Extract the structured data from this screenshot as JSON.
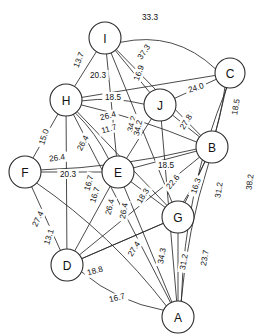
{
  "chart_data": {
    "type": "diagram",
    "title": "",
    "subtitle": "",
    "xlabel": "",
    "ylabel": "",
    "graph_kind": "weighted-undirected-graph",
    "nodes": [
      {
        "id": "I",
        "label": "I",
        "x": 105,
        "y": 38,
        "r": 16
      },
      {
        "id": "C",
        "label": "C",
        "x": 230,
        "y": 73,
        "r": 15
      },
      {
        "id": "H",
        "label": "H",
        "x": 66,
        "y": 100,
        "r": 16
      },
      {
        "id": "J",
        "label": "J",
        "x": 160,
        "y": 105,
        "r": 16
      },
      {
        "id": "B",
        "label": "B",
        "x": 212,
        "y": 147,
        "r": 16
      },
      {
        "id": "F",
        "label": "F",
        "x": 25,
        "y": 172,
        "r": 16
      },
      {
        "id": "E",
        "label": "E",
        "x": 118,
        "y": 172,
        "r": 16
      },
      {
        "id": "G",
        "label": "G",
        "x": 178,
        "y": 217,
        "r": 16
      },
      {
        "id": "D",
        "label": "D",
        "x": 67,
        "y": 265,
        "r": 16
      },
      {
        "id": "A",
        "label": "A",
        "x": 178,
        "y": 317,
        "r": 16
      }
    ],
    "edges": [
      {
        "source": "I",
        "target": "C",
        "weight": "33.3",
        "lx": 150,
        "ly": 17,
        "curve": -26,
        "rot": 0
      },
      {
        "source": "I",
        "target": "H",
        "weight": "13.7",
        "lx": 79,
        "ly": 60,
        "curve": 0,
        "rot": -68
      },
      {
        "source": "I",
        "target": "B",
        "weight": "37.3",
        "lx": 144,
        "ly": 52,
        "curve": 0,
        "rot": -56
      },
      {
        "source": "I",
        "target": "J",
        "weight": "16.9",
        "lx": 139,
        "ly": 73,
        "curve": 0,
        "rot": -70
      },
      {
        "source": "I",
        "target": "E",
        "weight": "34.2",
        "lx": 132,
        "ly": 124,
        "curve": 0,
        "rot": -76
      },
      {
        "source": "I",
        "target": "G",
        "weight": "27.8",
        "lx": 187,
        "ly": 119,
        "curve": 0,
        "rot": -60
      },
      {
        "source": "H",
        "target": "J",
        "weight": "20.3",
        "lx": 98,
        "ly": 75,
        "curve": -6,
        "rot": 0
      },
      {
        "source": "H",
        "target": "C",
        "weight": "18.5",
        "lx": 113,
        "ly": 97,
        "curve": 0,
        "rot": 0
      },
      {
        "source": "H",
        "target": "B",
        "weight": "26.4",
        "lx": 108,
        "ly": 116,
        "curve": -5,
        "rot": -14
      },
      {
        "source": "H",
        "target": "E",
        "weight": "11.7",
        "lx": 109,
        "ly": 129,
        "curve": -5,
        "rot": -16
      },
      {
        "source": "H",
        "target": "F",
        "weight": "15.0",
        "lx": 44,
        "ly": 137,
        "curve": 0,
        "rot": -72
      },
      {
        "source": "H",
        "target": "G",
        "weight": "26.4",
        "lx": 83,
        "ly": 143,
        "curve": 0,
        "rot": -62
      },
      {
        "source": "H",
        "target": "A",
        "weight": "16.7",
        "lx": 89,
        "ly": 183,
        "curve": 0,
        "rot": -74
      },
      {
        "source": "H",
        "target": "D",
        "weight": "26.4",
        "lx": 110,
        "ly": 207,
        "curve": 0,
        "rot": -76
      },
      {
        "source": "C",
        "target": "J",
        "weight": "24.0",
        "lx": 196,
        "ly": 88,
        "curve": 0,
        "rot": -18
      },
      {
        "source": "C",
        "target": "B",
        "weight": "18.5",
        "lx": 236,
        "ly": 107,
        "curve": 0,
        "rot": -80
      },
      {
        "source": "C",
        "target": "A",
        "weight": "38.2",
        "lx": 250,
        "ly": 182,
        "curve": 20,
        "rot": -83
      },
      {
        "source": "J",
        "target": "B",
        "weight": "27.8",
        "lx": 186,
        "ly": 122,
        "curve": 0,
        "rot": -58
      },
      {
        "source": "J",
        "target": "E",
        "weight": "34.2",
        "lx": 138,
        "ly": 128,
        "curve": 0,
        "rot": -77
      },
      {
        "source": "J",
        "target": "A",
        "weight": "34.3",
        "lx": 162,
        "ly": 256,
        "curve": 0,
        "rot": -80
      },
      {
        "source": "B",
        "target": "E",
        "weight": "18.5",
        "lx": 166,
        "ly": 165,
        "curve": 0,
        "rot": 0
      },
      {
        "source": "B",
        "target": "F",
        "weight": "26.4",
        "lx": 57,
        "ly": 158,
        "curve": -8,
        "rot": -8
      },
      {
        "source": "B",
        "target": "G",
        "weight": "16.3",
        "lx": 196,
        "ly": 186,
        "curve": 0,
        "rot": -72
      },
      {
        "source": "B",
        "target": "D",
        "weight": "22.6",
        "lx": 173,
        "ly": 182,
        "curve": 0,
        "rot": -50
      },
      {
        "source": "B",
        "target": "A",
        "weight": "31.2",
        "lx": 219,
        "ly": 190,
        "curve": 8,
        "rot": -82
      },
      {
        "source": "F",
        "target": "E",
        "weight": "20.3",
        "lx": 68,
        "ly": 174,
        "curve": 0,
        "rot": 0
      },
      {
        "source": "F",
        "target": "D",
        "weight": "13.1",
        "lx": 49,
        "ly": 237,
        "curve": 0,
        "rot": -72
      },
      {
        "source": "F",
        "target": "A",
        "weight": "27.4",
        "lx": 38,
        "ly": 219,
        "curve": -14,
        "rot": -64
      },
      {
        "source": "E",
        "target": "G",
        "weight": "18.3",
        "lx": 143,
        "ly": 196,
        "curve": 0,
        "rot": -58
      },
      {
        "source": "E",
        "target": "D",
        "weight": "16.7",
        "lx": 95,
        "ly": 195,
        "curve": 0,
        "rot": -72
      },
      {
        "source": "E",
        "target": "A",
        "weight": "26.4",
        "lx": 124,
        "ly": 211,
        "curve": 0,
        "rot": -80
      },
      {
        "source": "G",
        "target": "A",
        "weight": "31.2",
        "lx": 184,
        "ly": 262,
        "curve": 0,
        "rot": -80
      },
      {
        "source": "G",
        "target": "D",
        "weight": "27.4",
        "lx": 134,
        "ly": 249,
        "curve": 0,
        "rot": -58
      },
      {
        "source": "G",
        "target": "C",
        "weight": "23.7",
        "lx": 205,
        "ly": 258,
        "curve": 14,
        "rot": -80
      },
      {
        "source": "D",
        "target": "G",
        "weight": "18.8",
        "lx": 95,
        "ly": 271,
        "curve": 0,
        "rot": -16
      },
      {
        "source": "D",
        "target": "A",
        "weight": "16.7",
        "lx": 117,
        "ly": 298,
        "curve": 12,
        "rot": -14
      }
    ],
    "weights_list": [
      "33.3",
      "13.7",
      "37.3",
      "16.9",
      "20.3",
      "18.5",
      "24.0",
      "18.5",
      "26.4",
      "11.7",
      "34.2",
      "27.8",
      "15.0",
      "26.4",
      "26.4",
      "20.3",
      "18.5",
      "22.6",
      "16.3",
      "31.2",
      "38.2",
      "16.7",
      "26.4",
      "18.3",
      "27.4",
      "13.1",
      "18.8",
      "27.4",
      "34.3",
      "31.2",
      "23.7",
      "16.7"
    ],
    "style": {
      "background": "#ffffff",
      "edge_color": "#2b2b2b",
      "node_fill": "#ffffff",
      "node_stroke": "#2b2b2b",
      "label_color": "#111111"
    },
    "grid": false,
    "legend": false
  }
}
